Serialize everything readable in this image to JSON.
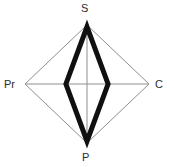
{
  "chart_data": {
    "type": "radar",
    "title": "",
    "subtitle": "",
    "xlabel": "",
    "ylabel": "",
    "grid": false,
    "legend": "none",
    "categories": [
      "S",
      "C",
      "P",
      "Pr"
    ],
    "axis_labels": {
      "top": "S",
      "right": "C",
      "bottom": "P",
      "left": "Pr"
    },
    "rlim": [
      0,
      1
    ],
    "series": [
      {
        "name": "series-1",
        "values": [
          0.97,
          0.34,
          0.97,
          0.34
        ]
      }
    ],
    "colors": {
      "series_stroke": "#101010",
      "grid_outline": "#8f8f8f",
      "axis_line": "#8f8f8f",
      "background": "#ffffff",
      "label_text": "#2b2b2b"
    },
    "geometry": {
      "center_x": 87,
      "center_y": 84,
      "radius_x": 62,
      "radius_y": 59,
      "series_stroke_width": 5
    }
  }
}
